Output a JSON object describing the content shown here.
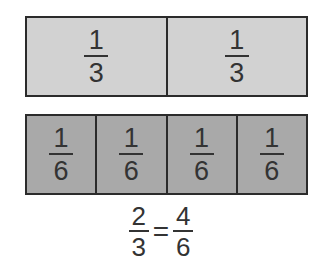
{
  "thirds_bar": {
    "fill": "#d2d2d2",
    "cells": [
      {
        "numerator": "1",
        "denominator": "3"
      },
      {
        "numerator": "1",
        "denominator": "3"
      }
    ]
  },
  "sixths_bar": {
    "fill": "#a9a9a9",
    "cells": [
      {
        "numerator": "1",
        "denominator": "6"
      },
      {
        "numerator": "1",
        "denominator": "6"
      },
      {
        "numerator": "1",
        "denominator": "6"
      },
      {
        "numerator": "1",
        "denominator": "6"
      }
    ]
  },
  "equation": {
    "left": {
      "numerator": "2",
      "denominator": "3"
    },
    "sign": "=",
    "right": {
      "numerator": "4",
      "denominator": "6"
    }
  }
}
